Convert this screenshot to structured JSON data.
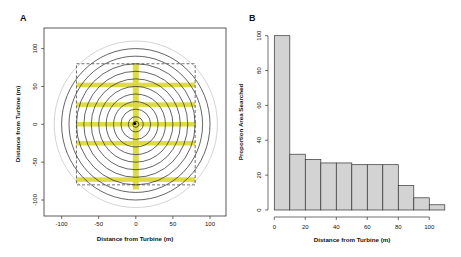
{
  "chart_data": [
    {
      "panel": "A",
      "type": "scatter",
      "title": "",
      "xlabel": "Distance from Turbine (m)",
      "ylabel": "Distance from Turbine (m)",
      "xlim": [
        -120,
        120
      ],
      "ylim": [
        -125,
        125
      ],
      "xticks": [
        -100,
        -50,
        0,
        50,
        100
      ],
      "yticks": [
        -100,
        -50,
        0,
        50,
        100
      ],
      "grid": false,
      "turbine_center": [
        0,
        0
      ],
      "concentric_circles_radii_m": [
        10,
        20,
        30,
        40,
        50,
        60,
        70,
        80,
        90,
        100
      ],
      "outer_gray_circle_radius_m": 110,
      "search_plot_rectangle": {
        "xmin": -80,
        "xmax": 80,
        "ymin": -80,
        "ymax": 80,
        "style": "dashed"
      },
      "transects": {
        "horizontal_y_m": [
          52,
          26,
          0,
          -25,
          -73
        ],
        "horizontal_x_range_m": [
          -80,
          80
        ],
        "vertical_x_m": 0,
        "vertical_y_range_m": [
          -80,
          80
        ],
        "width_m": 6,
        "color": "#dcd93a"
      }
    },
    {
      "panel": "B",
      "type": "bar",
      "title": "",
      "xlabel": "Distance from Turbine (m)",
      "ylabel": "Proportion Area Searched",
      "bin_edges": [
        0,
        10,
        20,
        30,
        40,
        50,
        60,
        70,
        80,
        90,
        100,
        110
      ],
      "categories": [
        "0-10",
        "10-20",
        "20-30",
        "30-40",
        "40-50",
        "50-60",
        "60-70",
        "70-80",
        "80-90",
        "90-100",
        "100-110"
      ],
      "values": [
        100,
        32,
        29,
        27,
        27,
        26,
        26,
        26,
        14,
        7,
        3
      ],
      "xticks": [
        0,
        20,
        40,
        60,
        80,
        100
      ],
      "yticks": [
        0,
        20,
        40,
        60,
        80,
        100
      ],
      "ylim": [
        0,
        100
      ],
      "bar_color": "#d3d3d3",
      "grid": false
    }
  ],
  "panels": {
    "a": {
      "label": "A",
      "xlabel": "Distance from Turbine (m)",
      "ylabel": "Distance from Turbine (m)",
      "xticks": [
        "-100",
        "-50",
        "0",
        "50",
        "100"
      ],
      "yticks": [
        "100",
        "50",
        "0",
        "-50",
        "-100"
      ]
    },
    "b": {
      "label": "B",
      "xlabel": "Distance from Turbine (m)",
      "ylabel": "Proportion Area Searched",
      "xticks": [
        "0",
        "20",
        "40",
        "60",
        "80",
        "100"
      ],
      "yticks": [
        "0",
        "20",
        "40",
        "60",
        "80",
        "100"
      ]
    }
  }
}
